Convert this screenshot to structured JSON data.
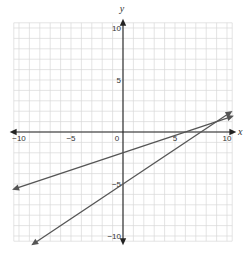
{
  "chart_data": {
    "type": "line",
    "title": "",
    "xlabel": "x",
    "ylabel": "y",
    "xlim": [
      -10,
      10
    ],
    "ylim": [
      -10,
      10
    ],
    "grid": true,
    "grid_step": 1,
    "x_tick_labels": [
      {
        "value": -10,
        "label": "−10"
      },
      {
        "value": -5,
        "label": "−5"
      },
      {
        "value": 0,
        "label": "0"
      },
      {
        "value": 5,
        "label": "5"
      },
      {
        "value": 10,
        "label": "10"
      }
    ],
    "y_tick_labels": [
      {
        "value": 10,
        "label": "10"
      },
      {
        "value": 5,
        "label": "5"
      },
      {
        "value": -5,
        "label": "−5"
      },
      {
        "value": -10,
        "label": "−10"
      }
    ],
    "series": [
      {
        "name": "line-1",
        "equation": "y = (1/3)x - 2",
        "slope": 0.3333,
        "intercept": -2,
        "x": [
          -10.3,
          10.3
        ],
        "y": [
          -5.43,
          1.43
        ],
        "arrows": "both"
      },
      {
        "name": "line-2",
        "equation": "y = (2/3)x - 5",
        "slope": 0.6667,
        "intercept": -5,
        "x": [
          -8.5,
          10.2
        ],
        "y": [
          -10.67,
          1.8
        ],
        "arrows": "both"
      }
    ],
    "intersection": {
      "x": 9,
      "y": 1
    },
    "legend": null
  },
  "colors": {
    "grid": "#d8d8d8",
    "axis": "#222222",
    "line": "#555555"
  }
}
